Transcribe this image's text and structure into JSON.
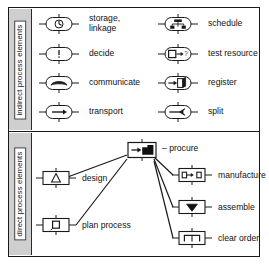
{
  "diagram": {
    "sections": [
      {
        "id": "indirect",
        "side_label": "indirect process elements",
        "shape": "stadium",
        "items": [
          {
            "icon": "clock-icon",
            "label": "storage,\nlinkage"
          },
          {
            "icon": "exclamation-icon",
            "label": "decide"
          },
          {
            "icon": "handset-icon",
            "label": "communicate"
          },
          {
            "icon": "right-arrow-icon",
            "label": "transport"
          },
          {
            "icon": "hierarchy-tree-icon",
            "label": "schedule"
          },
          {
            "icon": "box-arrow-question-icon",
            "label": "test resource"
          },
          {
            "icon": "arrow-into-book-icon",
            "label": "register"
          },
          {
            "icon": "split-arrow-icon",
            "label": "split"
          }
        ]
      },
      {
        "id": "direct",
        "side_label": "direct process elements",
        "shape": "rectangle",
        "items": [
          {
            "icon": "arrow-block-icon",
            "label": "procure",
            "prefix": "– "
          },
          {
            "icon": "triangle-icon",
            "label": "design"
          },
          {
            "icon": "small-square-icon",
            "label": "plan process"
          },
          {
            "icon": "box-to-box-arrow-icon",
            "label": "manufacture"
          },
          {
            "icon": "v-cup-icon",
            "label": "assemble"
          },
          {
            "icon": "gate-brackets-icon",
            "label": "clear order"
          }
        ],
        "edges": [
          {
            "from": "procure",
            "to": "design"
          },
          {
            "from": "procure",
            "to": "plan process"
          },
          {
            "from": "procure",
            "to": "manufacture"
          },
          {
            "from": "procure",
            "to": "assemble"
          },
          {
            "from": "procure",
            "to": "clear order"
          }
        ]
      }
    ],
    "colors": {
      "line": "#1a1a1a",
      "tab_fill": "#cfcfcf",
      "fill": "#ffffff",
      "accent_dark": "#111111"
    }
  }
}
